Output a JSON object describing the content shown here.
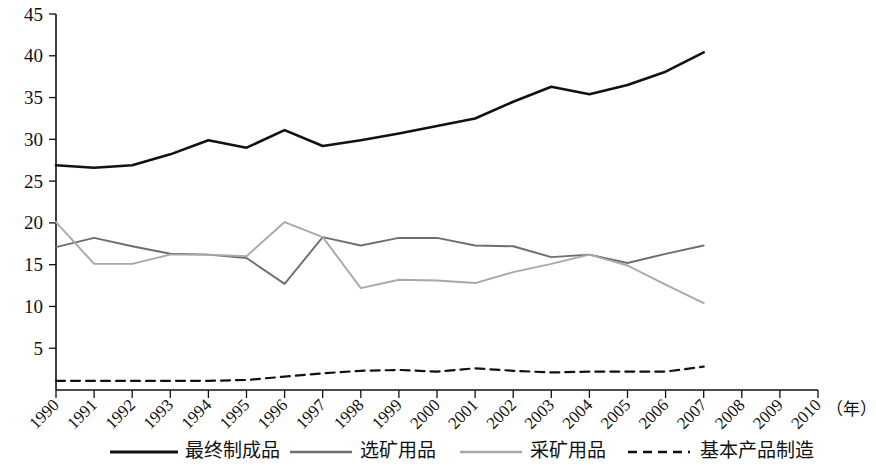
{
  "chart_data": {
    "type": "line",
    "title": "",
    "subtitle": "",
    "xlabel": "（年）",
    "ylabel": "",
    "xlim": [
      1990,
      2010
    ],
    "ylim": [
      0,
      45
    ],
    "grid": false,
    "legend_position": "bottom",
    "x": [
      1990,
      1991,
      1992,
      1993,
      1994,
      1995,
      1996,
      1997,
      1998,
      1999,
      2000,
      2001,
      2002,
      2003,
      2004,
      2005,
      2006,
      2007
    ],
    "xtick_labels": [
      "1990",
      "1991",
      "1992",
      "1993",
      "1994",
      "1995",
      "1996",
      "1997",
      "1998",
      "1999",
      "2000",
      "2001",
      "2002",
      "2003",
      "2004",
      "2005",
      "2006",
      "2007",
      "2008",
      "2009",
      "2010"
    ],
    "xticks": [
      1990,
      1991,
      1992,
      1993,
      1994,
      1995,
      1996,
      1997,
      1998,
      1999,
      2000,
      2001,
      2002,
      2003,
      2004,
      2005,
      2006,
      2007,
      2008,
      2009,
      2010
    ],
    "yticks": [
      5,
      10,
      15,
      20,
      25,
      30,
      35,
      40,
      45
    ],
    "ytick_labels": [
      "5",
      "10",
      "15",
      "20",
      "25",
      "30",
      "35",
      "40",
      "45"
    ],
    "series": [
      {
        "name": "最终制成品",
        "style": "solid",
        "color": "#111111",
        "width": 2.6,
        "values": [
          26.9,
          26.6,
          26.9,
          28.2,
          29.9,
          29.0,
          31.1,
          29.2,
          29.9,
          30.7,
          31.6,
          32.5,
          34.5,
          36.3,
          35.4,
          36.5,
          38.1,
          40.4
        ]
      },
      {
        "name": "选矿用品",
        "style": "solid",
        "color": "#6e6e6e",
        "width": 1.9,
        "values": [
          17.1,
          18.2,
          17.2,
          16.3,
          16.2,
          15.8,
          12.7,
          18.3,
          17.3,
          18.2,
          18.2,
          17.3,
          17.2,
          15.9,
          16.2,
          15.2,
          16.3,
          17.3
        ]
      },
      {
        "name": "采矿用品",
        "style": "solid",
        "color": "#a8a8a8",
        "width": 1.9,
        "values": [
          20.1,
          15.1,
          15.1,
          16.2,
          16.2,
          16.0,
          20.1,
          18.3,
          12.2,
          13.2,
          13.1,
          12.8,
          14.1,
          15.1,
          16.2,
          14.9,
          12.6,
          10.4
        ]
      },
      {
        "name": "基本产品制造",
        "style": "dashed",
        "color": "#111111",
        "width": 2.2,
        "values": [
          1.1,
          1.1,
          1.1,
          1.1,
          1.1,
          1.2,
          1.6,
          2.0,
          2.3,
          2.4,
          2.2,
          2.6,
          2.3,
          2.1,
          2.2,
          2.2,
          2.2,
          2.8
        ]
      }
    ]
  },
  "legend": {
    "items": [
      {
        "label": "最终制成品"
      },
      {
        "label": "选矿用品"
      },
      {
        "label": "采矿用品"
      },
      {
        "label": "基本产品制造"
      }
    ]
  }
}
